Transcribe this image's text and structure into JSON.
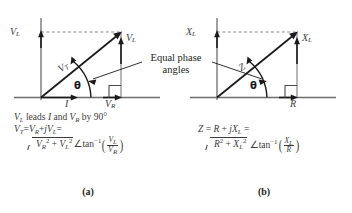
{
  "figure": {
    "annotation": {
      "line1": "Equal phase",
      "line2": "angles"
    },
    "panels": [
      {
        "id": "a",
        "caption": "(a)",
        "axis_vertical_label": "V",
        "axis_vertical_sub": "L",
        "vector_tip_label": "V",
        "vector_tip_sub": "L",
        "diagonal_label": "V",
        "diagonal_sub": "T",
        "axis_h_label_1": "I",
        "axis_h_label_2": "V",
        "axis_h_label_2_sub": "R",
        "angle_label": "θ",
        "equations": {
          "line1_pre": "V",
          "line1_sub": "L",
          "line1_text": " leads ",
          "line1_i": "I",
          "line1_mid": " and ",
          "line1_vr": "V",
          "line1_vr_sub": "R",
          "line1_post": " by 90°",
          "line2": "V_T = V_R + jV_L =",
          "line3": "√(V_R² + V_L²) ∠tan⁻¹(V_L/V_R)",
          "num": "V",
          "num_sub": "L",
          "den": "V",
          "den_sub": "R",
          "rad_a": "V",
          "rad_a_sub": "R",
          "rad_b": "V",
          "rad_b_sub": "L"
        }
      },
      {
        "id": "b",
        "caption": "(b)",
        "axis_vertical_label": "X",
        "axis_vertical_sub": "L",
        "vector_tip_label": "X",
        "vector_tip_sub": "L",
        "diagonal_label": "Z",
        "diagonal_sub": "",
        "axis_h_label_1": "",
        "axis_h_label_2": "R",
        "axis_h_label_2_sub": "",
        "angle_label": "θ",
        "equations": {
          "line2": "Z = R + jX_L =",
          "line3": "√(R² + X_L²) ∠tan⁻¹(X_L/R)",
          "num": "X",
          "num_sub": "L",
          "den": "R",
          "den_sub": "",
          "rad_a": "R",
          "rad_a_sub": "",
          "rad_b": "X",
          "rad_b_sub": "L"
        }
      }
    ],
    "symbols": {
      "angle": "∠",
      "tan_inverse": "tan",
      "tan_exp": "−1",
      "plus": "+",
      "equals": "=",
      "j": "j",
      "squared": "2",
      "degree": "°"
    },
    "colors": {
      "axis": "#6e6e6e",
      "vector": "#1a1a1a",
      "dashed": "#8a8a8a",
      "text": "#231f20",
      "label": "#3b3b3b",
      "background": "#ffffff"
    }
  }
}
